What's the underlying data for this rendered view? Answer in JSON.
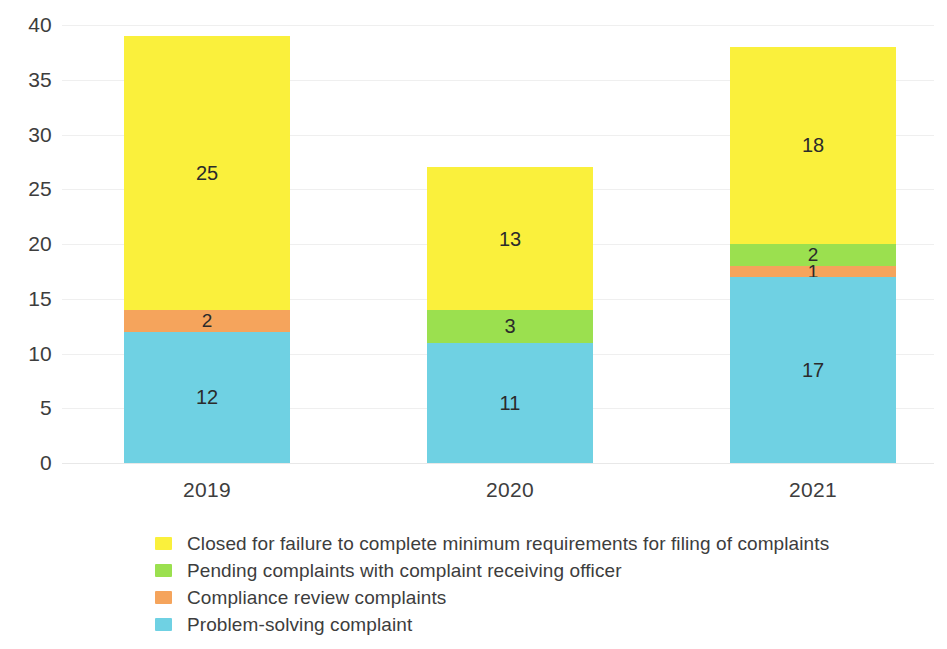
{
  "chart_data": {
    "type": "bar",
    "subtype": "stacked-bar",
    "title": "",
    "xlabel": "",
    "ylabel": "",
    "categories": [
      "2019",
      "2020",
      "2021"
    ],
    "ylim": [
      0,
      40
    ],
    "yticks": [
      0,
      5,
      10,
      15,
      20,
      25,
      30,
      35,
      40
    ],
    "ytick_labels": [
      "0",
      "5",
      "10",
      "15",
      "20",
      "25",
      "30",
      "35",
      "40"
    ],
    "grid": true,
    "grid_axis": "y",
    "legend_position": "bottom-left",
    "stack_order_bottom_to_top": [
      "Problem-solving complaint",
      "Compliance review complaints",
      "Pending complaints with complaint receiving officer",
      "Closed for failure to complete minimum requirements for filing of complaints"
    ],
    "series": [
      {
        "name": "Closed for failure to complete minimum requirements for filing of complaints",
        "color": "#FAF03C",
        "values": [
          25,
          13,
          18
        ],
        "labels": [
          "25",
          "13",
          "18"
        ]
      },
      {
        "name": "Pending complaints with complaint receiving officer",
        "color": "#9BE04F",
        "values": [
          0,
          3,
          2
        ],
        "labels": [
          "",
          "3",
          "2"
        ]
      },
      {
        "name": "Compliance review complaints",
        "color": "#F5A45C",
        "values": [
          2,
          0,
          1
        ],
        "labels": [
          "2",
          "",
          "1"
        ]
      },
      {
        "name": "Problem-solving complaint",
        "color": "#6FD1E3",
        "values": [
          12,
          11,
          17
        ],
        "labels": [
          "12",
          "11",
          "17"
        ]
      }
    ],
    "totals": [
      39,
      27,
      38
    ]
  },
  "axes": {
    "y_ticks": [
      {
        "label": "40",
        "value": 40
      },
      {
        "label": "35",
        "value": 35
      },
      {
        "label": "30",
        "value": 30
      },
      {
        "label": "25",
        "value": 25
      },
      {
        "label": "20",
        "value": 20
      },
      {
        "label": "15",
        "value": 15
      },
      {
        "label": "10",
        "value": 10
      },
      {
        "label": "5",
        "value": 5
      },
      {
        "label": "0",
        "value": 0
      }
    ],
    "x_ticks": [
      {
        "label": "2019"
      },
      {
        "label": "2020"
      },
      {
        "label": "2021"
      }
    ]
  },
  "bars": [
    {
      "category": "2019",
      "total": 39,
      "segments": [
        {
          "series": "Closed for failure to complete minimum requirements for filing of complaints",
          "value": 25,
          "label": "25",
          "color": "#FAF03C"
        },
        {
          "series": "Compliance review complaints",
          "value": 2,
          "label": "2",
          "color": "#F5A45C"
        },
        {
          "series": "Problem-solving complaint",
          "value": 12,
          "label": "12",
          "color": "#6FD1E3"
        }
      ]
    },
    {
      "category": "2020",
      "total": 27,
      "segments": [
        {
          "series": "Closed for failure to complete minimum requirements for filing of complaints",
          "value": 13,
          "label": "13",
          "color": "#FAF03C"
        },
        {
          "series": "Pending complaints with complaint receiving officer",
          "value": 3,
          "label": "3",
          "color": "#9BE04F"
        },
        {
          "series": "Problem-solving complaint",
          "value": 11,
          "label": "11",
          "color": "#6FD1E3"
        }
      ]
    },
    {
      "category": "2021",
      "total": 38,
      "segments": [
        {
          "series": "Closed for failure to complete minimum requirements for filing of complaints",
          "value": 18,
          "label": "18",
          "color": "#FAF03C"
        },
        {
          "series": "Pending complaints with complaint receiving officer",
          "value": 2,
          "label": "2",
          "color": "#9BE04F"
        },
        {
          "series": "Compliance review complaints",
          "value": 1,
          "label": "1",
          "color": "#F5A45C"
        },
        {
          "series": "Problem-solving complaint",
          "value": 17,
          "label": "17",
          "color": "#6FD1E3"
        }
      ]
    }
  ],
  "legend": {
    "items": [
      {
        "label": "Closed for failure to complete minimum requirements for filing of complaints",
        "color": "#FAF03C"
      },
      {
        "label": "Pending complaints with complaint receiving officer",
        "color": "#9BE04F"
      },
      {
        "label": "Compliance review complaints",
        "color": "#F5A45C"
      },
      {
        "label": "Problem-solving complaint",
        "color": "#6FD1E3"
      }
    ]
  },
  "colors": {
    "yellow": "#FAF03C",
    "green": "#9BE04F",
    "orange": "#F5A45C",
    "blue": "#6FD1E3",
    "grid": "#efefef",
    "text": "#3d3d3d",
    "background": "#ffffff"
  }
}
